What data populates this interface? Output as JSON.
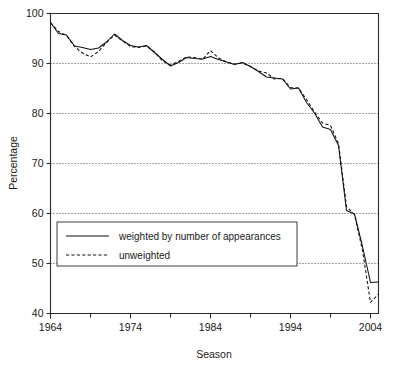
{
  "chart_data": {
    "type": "line",
    "title": "",
    "xlabel": "Season",
    "ylabel": "Percentage",
    "xlim": [
      1964,
      2005
    ],
    "ylim": [
      40,
      100
    ],
    "grid": true,
    "gridlines_y": [
      50,
      60,
      70,
      80,
      90
    ],
    "legend_position": "lower-left-inside",
    "x_major_ticks": [
      1964,
      1974,
      1984,
      1994,
      2004
    ],
    "x_minor_ticks": [
      1969,
      1979,
      1989,
      1999
    ],
    "x_tick_labels": [
      "1964",
      "1974",
      "1984",
      "1994",
      "2004"
    ],
    "y_ticks": [
      40,
      50,
      60,
      70,
      80,
      90,
      100
    ],
    "y_tick_labels": [
      "40",
      "50",
      "60",
      "70",
      "80",
      "90",
      "100"
    ],
    "x": [
      1964,
      1965,
      1966,
      1967,
      1968,
      1969,
      1970,
      1971,
      1972,
      1973,
      1974,
      1975,
      1976,
      1977,
      1978,
      1979,
      1980,
      1981,
      1982,
      1983,
      1984,
      1985,
      1986,
      1987,
      1988,
      1989,
      1990,
      1991,
      1992,
      1993,
      1994,
      1995,
      1996,
      1997,
      1998,
      1999,
      2000,
      2001,
      2002,
      2003,
      2004,
      2005
    ],
    "series": [
      {
        "name": "weighted by number of appearances",
        "style": "solid",
        "values": [
          98.2,
          96.0,
          95.7,
          93.5,
          93.2,
          92.8,
          93.1,
          94.3,
          95.9,
          94.6,
          93.6,
          93.3,
          93.6,
          92.2,
          90.8,
          89.5,
          90.2,
          91.2,
          91.0,
          90.9,
          91.4,
          90.8,
          90.3,
          89.8,
          90.2,
          89.4,
          88.4,
          87.3,
          87.1,
          86.9,
          84.9,
          85.1,
          82.2,
          80.1,
          77.3,
          76.8,
          73.6,
          60.6,
          59.9,
          53.4,
          46.2,
          46.3
        ]
      },
      {
        "name": "unweighted",
        "style": "dashed",
        "values": [
          98.2,
          96.4,
          95.6,
          93.4,
          92.1,
          91.3,
          92.4,
          94.2,
          95.7,
          94.5,
          93.4,
          93.2,
          93.5,
          92.3,
          90.5,
          89.7,
          90.4,
          91.3,
          91.2,
          90.8,
          92.6,
          91.1,
          90.3,
          89.9,
          90.1,
          89.4,
          88.5,
          88.1,
          86.9,
          87.0,
          85.2,
          85.1,
          82.8,
          80.3,
          78.1,
          77.6,
          74.0,
          61.4,
          59.8,
          52.6,
          42.2,
          43.9
        ]
      }
    ]
  },
  "legend": {
    "entries": [
      {
        "label": "weighted by number of appearances",
        "style": "solid"
      },
      {
        "label": "unweighted",
        "style": "dashed"
      }
    ]
  }
}
